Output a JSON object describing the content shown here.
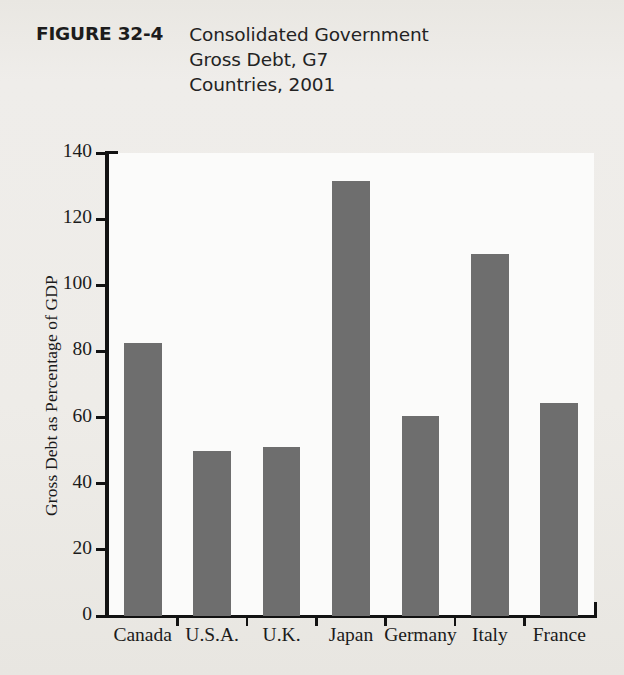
{
  "figure": {
    "label": "FIGURE 32-4",
    "caption_lines": [
      "Consolidated Government",
      "Gross Debt, G7",
      "Countries, 2001"
    ],
    "caption_full": "Consolidated Government Gross Debt, G7 Countries, 2001"
  },
  "colors": {
    "bar_fill": "#6e6e6e",
    "axis": "#121212",
    "page_background": "#edebe7",
    "plot_background": "#fbfbfa",
    "text": "#1b1b1b"
  },
  "chart_data": {
    "type": "bar",
    "title": "Consolidated Government Gross Debt, G7 Countries, 2001",
    "categories": [
      "Canada",
      "U.S.A.",
      "U.K.",
      "Japan",
      "Germany",
      "Italy",
      "France"
    ],
    "values": [
      82.5,
      50,
      51,
      131.5,
      60.5,
      109.5,
      64.5
    ],
    "xlabel": "",
    "ylabel": "Gross Debt as Percentage of GDP",
    "ylim": [
      0,
      140
    ],
    "yticks": [
      0,
      20,
      40,
      60,
      80,
      100,
      120,
      140
    ],
    "ytick_labels": [
      "0",
      "20",
      "40",
      "60",
      "80",
      "100",
      "120",
      "140"
    ],
    "grid": false,
    "legend": false
  }
}
